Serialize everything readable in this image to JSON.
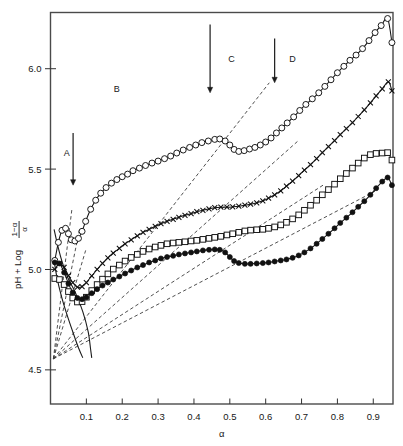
{
  "chart_data": {
    "type": "line",
    "title": "",
    "subtitle": "",
    "xlabel": "α",
    "ylabel_parts": {
      "prefix": "pH + Log",
      "numerator": "1−α",
      "denominator": "α"
    },
    "ylabel": "pH + Log (1−α)/α",
    "xlim": [
      0.0,
      0.955
    ],
    "ylim": [
      4.33,
      6.28
    ],
    "xticks": [
      0.1,
      0.2,
      0.3,
      0.4,
      0.5,
      0.6,
      0.7,
      0.8,
      0.9
    ],
    "xticklabels": [
      "0.1",
      "0.2",
      "0.3",
      "0.4",
      "0.5",
      "0.6",
      "0.7",
      "0.8",
      "0.9"
    ],
    "yticks": [
      4.5,
      5.0,
      5.5,
      6.0
    ],
    "yticklabels": [
      "4.5",
      "5.0",
      "5.5",
      "6.0"
    ],
    "grid": false,
    "legend": "none",
    "frame": "box",
    "annotations": [
      {
        "name": "region-label-a",
        "text": "A",
        "x": 0.045,
        "y": 5.565
      },
      {
        "name": "region-label-b",
        "text": "B",
        "x": 0.185,
        "y": 5.885
      },
      {
        "name": "region-label-c",
        "text": "C",
        "x": 0.505,
        "y": 6.035
      },
      {
        "name": "region-label-d",
        "text": "D",
        "x": 0.675,
        "y": 6.035
      }
    ],
    "arrows": [
      {
        "name": "arrow-a",
        "x": 0.063,
        "y_top": 5.68,
        "y_bottom": 5.42
      },
      {
        "name": "arrow-b",
        "x": 0.445,
        "y_top": 6.22,
        "y_bottom": 5.88
      },
      {
        "name": "arrow-c",
        "x": 0.625,
        "y_top": 6.15,
        "y_bottom": 5.93
      }
    ],
    "series": [
      {
        "name": "open-circles",
        "marker": "open-circle",
        "linestyle": "solid",
        "points": [
          [
            0.012,
            5.045
          ],
          [
            0.022,
            5.135
          ],
          [
            0.032,
            5.195
          ],
          [
            0.042,
            5.205
          ],
          [
            0.05,
            5.178
          ],
          [
            0.058,
            5.148
          ],
          [
            0.068,
            5.142
          ],
          [
            0.078,
            5.155
          ],
          [
            0.088,
            5.19
          ],
          [
            0.098,
            5.24
          ],
          [
            0.112,
            5.3
          ],
          [
            0.126,
            5.345
          ],
          [
            0.14,
            5.38
          ],
          [
            0.155,
            5.408
          ],
          [
            0.17,
            5.43
          ],
          [
            0.185,
            5.448
          ],
          [
            0.2,
            5.462
          ],
          [
            0.215,
            5.475
          ],
          [
            0.23,
            5.492
          ],
          [
            0.248,
            5.505
          ],
          [
            0.265,
            5.518
          ],
          [
            0.283,
            5.53
          ],
          [
            0.3,
            5.54
          ],
          [
            0.318,
            5.552
          ],
          [
            0.335,
            5.565
          ],
          [
            0.352,
            5.58
          ],
          [
            0.37,
            5.595
          ],
          [
            0.388,
            5.608
          ],
          [
            0.405,
            5.62
          ],
          [
            0.422,
            5.632
          ],
          [
            0.44,
            5.64
          ],
          [
            0.458,
            5.648
          ],
          [
            0.472,
            5.65
          ],
          [
            0.487,
            5.64
          ],
          [
            0.5,
            5.62
          ],
          [
            0.512,
            5.598
          ],
          [
            0.525,
            5.588
          ],
          [
            0.54,
            5.592
          ],
          [
            0.555,
            5.6
          ],
          [
            0.57,
            5.608
          ],
          [
            0.585,
            5.62
          ],
          [
            0.6,
            5.635
          ],
          [
            0.615,
            5.655
          ],
          [
            0.63,
            5.68
          ],
          [
            0.645,
            5.705
          ],
          [
            0.66,
            5.73
          ],
          [
            0.678,
            5.76
          ],
          [
            0.695,
            5.792
          ],
          [
            0.712,
            5.822
          ],
          [
            0.73,
            5.85
          ],
          [
            0.748,
            5.88
          ],
          [
            0.765,
            5.912
          ],
          [
            0.782,
            5.945
          ],
          [
            0.8,
            5.98
          ],
          [
            0.818,
            6.012
          ],
          [
            0.835,
            6.042
          ],
          [
            0.852,
            6.068
          ],
          [
            0.87,
            6.1
          ],
          [
            0.888,
            6.14
          ],
          [
            0.905,
            6.18
          ],
          [
            0.922,
            6.215
          ],
          [
            0.94,
            6.25
          ],
          [
            0.952,
            6.13
          ]
        ]
      },
      {
        "name": "crosses",
        "marker": "cross",
        "linestyle": "solid",
        "points": [
          [
            0.012,
            5.0
          ],
          [
            0.025,
            5.03
          ],
          [
            0.038,
            5.01
          ],
          [
            0.05,
            4.97
          ],
          [
            0.062,
            4.935
          ],
          [
            0.075,
            4.912
          ],
          [
            0.088,
            4.915
          ],
          [
            0.1,
            4.935
          ],
          [
            0.115,
            4.968
          ],
          [
            0.13,
            5.0
          ],
          [
            0.145,
            5.03
          ],
          [
            0.16,
            5.058
          ],
          [
            0.175,
            5.082
          ],
          [
            0.192,
            5.105
          ],
          [
            0.208,
            5.128
          ],
          [
            0.225,
            5.148
          ],
          [
            0.242,
            5.168
          ],
          [
            0.258,
            5.185
          ],
          [
            0.275,
            5.2
          ],
          [
            0.292,
            5.215
          ],
          [
            0.308,
            5.228
          ],
          [
            0.325,
            5.24
          ],
          [
            0.342,
            5.25
          ],
          [
            0.358,
            5.26
          ],
          [
            0.375,
            5.27
          ],
          [
            0.392,
            5.278
          ],
          [
            0.408,
            5.288
          ],
          [
            0.425,
            5.295
          ],
          [
            0.442,
            5.302
          ],
          [
            0.458,
            5.308
          ],
          [
            0.475,
            5.31
          ],
          [
            0.492,
            5.31
          ],
          [
            0.508,
            5.312
          ],
          [
            0.525,
            5.315
          ],
          [
            0.542,
            5.32
          ],
          [
            0.558,
            5.325
          ],
          [
            0.575,
            5.332
          ],
          [
            0.592,
            5.342
          ],
          [
            0.608,
            5.355
          ],
          [
            0.625,
            5.372
          ],
          [
            0.642,
            5.392
          ],
          [
            0.658,
            5.415
          ],
          [
            0.675,
            5.44
          ],
          [
            0.692,
            5.468
          ],
          [
            0.708,
            5.495
          ],
          [
            0.725,
            5.522
          ],
          [
            0.742,
            5.552
          ],
          [
            0.758,
            5.582
          ],
          [
            0.775,
            5.612
          ],
          [
            0.792,
            5.642
          ],
          [
            0.808,
            5.672
          ],
          [
            0.825,
            5.702
          ],
          [
            0.842,
            5.732
          ],
          [
            0.858,
            5.762
          ],
          [
            0.875,
            5.795
          ],
          [
            0.892,
            5.83
          ],
          [
            0.908,
            5.865
          ],
          [
            0.925,
            5.9
          ],
          [
            0.942,
            5.935
          ],
          [
            0.952,
            5.89
          ]
        ]
      },
      {
        "name": "open-squares",
        "marker": "open-square",
        "linestyle": "solid",
        "points": [
          [
            0.012,
            4.955
          ],
          [
            0.025,
            4.95
          ],
          [
            0.038,
            4.925
          ],
          [
            0.05,
            4.89
          ],
          [
            0.062,
            4.858
          ],
          [
            0.075,
            4.838
          ],
          [
            0.088,
            4.84
          ],
          [
            0.1,
            4.862
          ],
          [
            0.115,
            4.895
          ],
          [
            0.13,
            4.925
          ],
          [
            0.145,
            4.952
          ],
          [
            0.16,
            4.978
          ],
          [
            0.175,
            5.002
          ],
          [
            0.192,
            5.022
          ],
          [
            0.208,
            5.042
          ],
          [
            0.225,
            5.06
          ],
          [
            0.242,
            5.075
          ],
          [
            0.258,
            5.09
          ],
          [
            0.275,
            5.102
          ],
          [
            0.292,
            5.112
          ],
          [
            0.308,
            5.12
          ],
          [
            0.325,
            5.128
          ],
          [
            0.342,
            5.132
          ],
          [
            0.358,
            5.135
          ],
          [
            0.375,
            5.138
          ],
          [
            0.392,
            5.142
          ],
          [
            0.408,
            5.145
          ],
          [
            0.425,
            5.15
          ],
          [
            0.442,
            5.155
          ],
          [
            0.458,
            5.16
          ],
          [
            0.475,
            5.165
          ],
          [
            0.492,
            5.172
          ],
          [
            0.508,
            5.178
          ],
          [
            0.525,
            5.185
          ],
          [
            0.542,
            5.192
          ],
          [
            0.558,
            5.196
          ],
          [
            0.575,
            5.198
          ],
          [
            0.592,
            5.2
          ],
          [
            0.608,
            5.205
          ],
          [
            0.625,
            5.212
          ],
          [
            0.642,
            5.222
          ],
          [
            0.658,
            5.235
          ],
          [
            0.675,
            5.252
          ],
          [
            0.692,
            5.272
          ],
          [
            0.708,
            5.295
          ],
          [
            0.725,
            5.32
          ],
          [
            0.742,
            5.345
          ],
          [
            0.758,
            5.372
          ],
          [
            0.775,
            5.398
          ],
          [
            0.792,
            5.425
          ],
          [
            0.808,
            5.452
          ],
          [
            0.825,
            5.478
          ],
          [
            0.842,
            5.505
          ],
          [
            0.858,
            5.53
          ],
          [
            0.875,
            5.555
          ],
          [
            0.892,
            5.572
          ],
          [
            0.908,
            5.578
          ],
          [
            0.925,
            5.58
          ],
          [
            0.94,
            5.582
          ],
          [
            0.952,
            5.545
          ]
        ]
      },
      {
        "name": "filled-circles",
        "marker": "filled-circle",
        "linestyle": "solid",
        "points": [
          [
            0.012,
            5.035
          ],
          [
            0.025,
            5.03
          ],
          [
            0.038,
            4.985
          ],
          [
            0.05,
            4.93
          ],
          [
            0.062,
            4.885
          ],
          [
            0.075,
            4.858
          ],
          [
            0.088,
            4.852
          ],
          [
            0.1,
            4.862
          ],
          [
            0.115,
            4.882
          ],
          [
            0.13,
            4.902
          ],
          [
            0.145,
            4.92
          ],
          [
            0.16,
            4.935
          ],
          [
            0.175,
            4.95
          ],
          [
            0.192,
            4.965
          ],
          [
            0.208,
            4.98
          ],
          [
            0.225,
            4.995
          ],
          [
            0.242,
            5.01
          ],
          [
            0.258,
            5.022
          ],
          [
            0.275,
            5.035
          ],
          [
            0.292,
            5.045
          ],
          [
            0.308,
            5.055
          ],
          [
            0.325,
            5.062
          ],
          [
            0.342,
            5.068
          ],
          [
            0.358,
            5.075
          ],
          [
            0.375,
            5.08
          ],
          [
            0.392,
            5.085
          ],
          [
            0.408,
            5.09
          ],
          [
            0.425,
            5.095
          ],
          [
            0.442,
            5.098
          ],
          [
            0.458,
            5.1
          ],
          [
            0.472,
            5.098
          ],
          [
            0.487,
            5.085
          ],
          [
            0.5,
            5.062
          ],
          [
            0.512,
            5.042
          ],
          [
            0.525,
            5.032
          ],
          [
            0.542,
            5.028
          ],
          [
            0.558,
            5.028
          ],
          [
            0.575,
            5.03
          ],
          [
            0.592,
            5.032
          ],
          [
            0.608,
            5.035
          ],
          [
            0.625,
            5.04
          ],
          [
            0.642,
            5.045
          ],
          [
            0.658,
            5.05
          ],
          [
            0.675,
            5.058
          ],
          [
            0.692,
            5.07
          ],
          [
            0.708,
            5.085
          ],
          [
            0.725,
            5.105
          ],
          [
            0.742,
            5.128
          ],
          [
            0.758,
            5.152
          ],
          [
            0.775,
            5.178
          ],
          [
            0.792,
            5.205
          ],
          [
            0.808,
            5.232
          ],
          [
            0.825,
            5.258
          ],
          [
            0.842,
            5.285
          ],
          [
            0.858,
            5.312
          ],
          [
            0.875,
            5.34
          ],
          [
            0.892,
            5.372
          ],
          [
            0.908,
            5.405
          ],
          [
            0.925,
            5.438
          ],
          [
            0.94,
            5.458
          ],
          [
            0.952,
            5.42
          ]
        ]
      }
    ],
    "dashed_lines": [
      {
        "name": "dashed-ref-1",
        "x1": 0.008,
        "y1": 4.555,
        "x2": 0.06,
        "y2": 5.305
      },
      {
        "name": "dashed-ref-2",
        "x1": 0.008,
        "y1": 4.555,
        "x2": 0.082,
        "y2": 5.21
      },
      {
        "name": "dashed-ref-3",
        "x1": 0.008,
        "y1": 4.555,
        "x2": 0.098,
        "y2": 5.095
      },
      {
        "name": "dashed-ref-4",
        "x1": 0.008,
        "y1": 4.555,
        "x2": 0.61,
        "y2": 5.93
      },
      {
        "name": "dashed-ref-5",
        "x1": 0.008,
        "y1": 4.555,
        "x2": 0.69,
        "y2": 5.64
      },
      {
        "name": "dashed-ref-6",
        "x1": 0.008,
        "y1": 4.555,
        "x2": 0.76,
        "y2": 5.42
      },
      {
        "name": "dashed-ref-7",
        "x1": 0.008,
        "y1": 4.555,
        "x2": 0.905,
        "y2": 5.39
      }
    ],
    "extra_curves": [
      {
        "name": "solid-guide-upper",
        "points": [
          [
            0.01,
            5.2
          ],
          [
            0.02,
            5.12
          ],
          [
            0.032,
            5.04
          ],
          [
            0.048,
            4.96
          ],
          [
            0.068,
            4.89
          ],
          [
            0.09,
            4.79
          ],
          [
            0.105,
            4.69
          ],
          [
            0.112,
            4.6
          ],
          [
            0.115,
            4.56
          ]
        ]
      },
      {
        "name": "solid-guide-lower",
        "points": [
          [
            0.01,
            5.045
          ],
          [
            0.018,
            4.96
          ],
          [
            0.03,
            4.87
          ],
          [
            0.045,
            4.78
          ],
          [
            0.062,
            4.69
          ],
          [
            0.078,
            4.61
          ],
          [
            0.09,
            4.56
          ]
        ]
      }
    ]
  }
}
